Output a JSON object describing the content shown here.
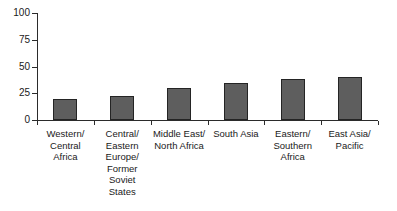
{
  "chart_data": {
    "type": "bar",
    "title": "",
    "subtitle": "",
    "xlabel": "",
    "ylabel": "",
    "ylim": [
      0,
      100
    ],
    "yticks": [
      0,
      25,
      50,
      75,
      100
    ],
    "ytick_labels": [
      "0",
      "25",
      "50",
      "75",
      "100"
    ],
    "grid": false,
    "legend": false,
    "legend_position": "none",
    "bar_color": "#5e5e5e",
    "bar_edge_color": "#242424",
    "axis_color": "#2b2b2b",
    "categories": [
      "Western/\nCentral\nAfrica",
      "Central/\nEastern\nEurope/\nFormer\nSoviet\nStates",
      "Middle East/\nNorth Africa",
      "South Asia",
      "Eastern/\nSouthern\nAfrica",
      "East Asia/\nPacific"
    ],
    "values": [
      20,
      22,
      30,
      35,
      38,
      40
    ]
  }
}
